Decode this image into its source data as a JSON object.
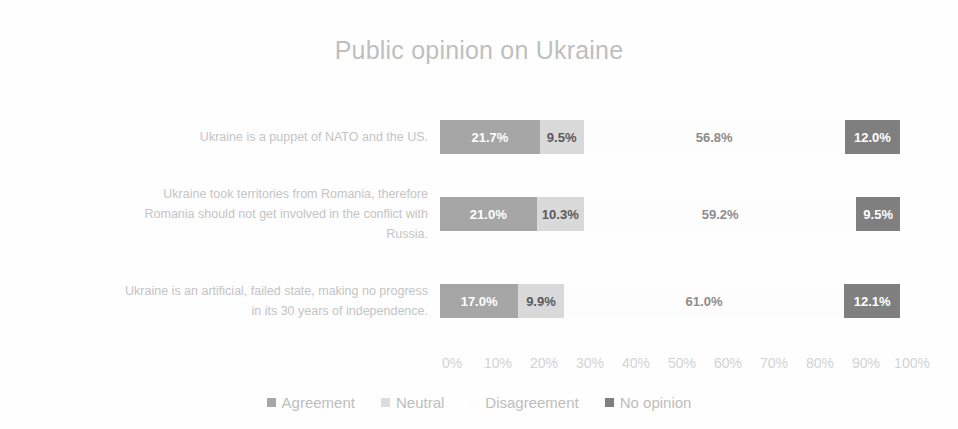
{
  "chart_data": {
    "type": "bar",
    "subtype": "stacked-horizontal-100",
    "title": "Public opinion on Ukraine",
    "xlabel": "",
    "ylabel": "",
    "xlim": [
      0,
      100
    ],
    "grid": false,
    "legend_position": "bottom",
    "categories": [
      "Ukraine is a puppet of NATO and the US.",
      "Ukraine took territories from Romania, therefore Romania should not get involved in the conflict with Russia.",
      "Ukraine is an artificial, failed state, making no progress in its 30 years of independence."
    ],
    "tick_labels": [
      "0%",
      "10%",
      "20%",
      "30%",
      "40%",
      "50%",
      "60%",
      "70%",
      "80%",
      "90%",
      "100%"
    ],
    "tick_values": [
      0,
      10,
      20,
      30,
      40,
      50,
      60,
      70,
      80,
      90,
      100
    ],
    "series": [
      {
        "name": "Agreement",
        "color": "#a6a6a6",
        "values": [
          21.7,
          21.0,
          17.0
        ],
        "labels": [
          "21.7%",
          "21.0%",
          "17.0%"
        ]
      },
      {
        "name": "Neutral",
        "color": "#d9d9d9",
        "values": [
          9.5,
          10.3,
          9.9
        ],
        "labels": [
          "9.5%",
          "10.3%",
          "9.9%"
        ]
      },
      {
        "name": "Disagreement",
        "color": "#fdfdfd",
        "values": [
          56.8,
          59.2,
          61.0
        ],
        "labels": [
          "56.8%",
          "59.2%",
          "61.0%"
        ]
      },
      {
        "name": "No opinion",
        "color": "#7f7f7f",
        "values": [
          12.0,
          9.5,
          12.1
        ],
        "labels": [
          "12.0%",
          "9.5%",
          "12.1%"
        ]
      }
    ]
  },
  "rows": [
    {
      "label": "Ukraine is a puppet of NATO and the US.",
      "label_lines": [
        "Ukraine is a puppet of NATO and the US."
      ],
      "agreement": "21.7%",
      "neutral": "9.5%",
      "disagreement": "56.8%",
      "no_opinion": "12.0%"
    },
    {
      "label": "Ukraine took territories from Romania, therefore Romania should not get involved in the conflict with Russia.",
      "label_lines": [
        "Ukraine took territories from Romania, therefore",
        "Romania should not get involved in the conflict with",
        "Russia."
      ],
      "agreement": "21.0%",
      "neutral": "10.3%",
      "disagreement": "59.2%",
      "no_opinion": "9.5%"
    },
    {
      "label": "Ukraine is an artificial, failed state, making no progress in its 30 years of independence.",
      "label_lines": [
        "Ukraine is an artificial, failed state, making no progress",
        "in its 30 years of independence."
      ],
      "agreement": "17.0%",
      "neutral": "9.9%",
      "disagreement": "61.0%",
      "no_opinion": "12.1%"
    }
  ],
  "axis": {
    "ticks": [
      "0%",
      "10%",
      "20%",
      "30%",
      "40%",
      "50%",
      "60%",
      "70%",
      "80%",
      "90%",
      "100%"
    ]
  },
  "legend": {
    "items": [
      {
        "label": "Agreement",
        "color": "#a6a6a6"
      },
      {
        "label": "Neutral",
        "color": "#d9d9d9"
      },
      {
        "label": "Disagreement",
        "color": "#fdfdfd"
      },
      {
        "label": "No opinion",
        "color": "#7f7f7f"
      }
    ]
  }
}
